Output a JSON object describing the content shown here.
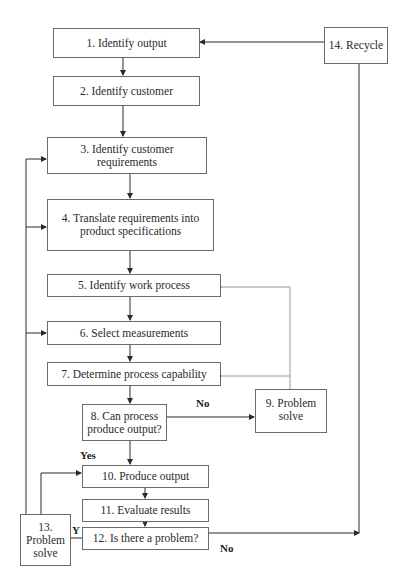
{
  "diagram": {
    "type": "flowchart",
    "nodes": [
      {
        "id": "1",
        "label": "1.  Identify output"
      },
      {
        "id": "2",
        "label": "2. Identify customer"
      },
      {
        "id": "3",
        "label": "3. Identify customer requirements"
      },
      {
        "id": "4",
        "label": "4. Translate requirements into product specifications"
      },
      {
        "id": "5",
        "label": "5. Identify work process"
      },
      {
        "id": "6",
        "label": "6. Select measurements"
      },
      {
        "id": "7",
        "label": "7. Determine process capability"
      },
      {
        "id": "8",
        "label": "8. Can process produce output?"
      },
      {
        "id": "9",
        "label": "9. Problem solve"
      },
      {
        "id": "10",
        "label": "10. Produce output"
      },
      {
        "id": "11",
        "label": "11. Evaluate results"
      },
      {
        "id": "12",
        "label": "12. Is there a problem?"
      },
      {
        "id": "13",
        "label": "13. Problem solve"
      },
      {
        "id": "14",
        "label": "14. Recycle"
      }
    ],
    "edges": [
      {
        "from": "1",
        "to": "2"
      },
      {
        "from": "2",
        "to": "3"
      },
      {
        "from": "3",
        "to": "4"
      },
      {
        "from": "4",
        "to": "5"
      },
      {
        "from": "5",
        "to": "6"
      },
      {
        "from": "6",
        "to": "7"
      },
      {
        "from": "7",
        "to": "8"
      },
      {
        "from": "8",
        "to": "9",
        "label": "No"
      },
      {
        "from": "8",
        "to": "10",
        "label": "Yes"
      },
      {
        "from": "9",
        "to": "5"
      },
      {
        "from": "9",
        "to": "7"
      },
      {
        "from": "10",
        "to": "11"
      },
      {
        "from": "11",
        "to": "12"
      },
      {
        "from": "12",
        "to": "13",
        "label": "Y"
      },
      {
        "from": "12",
        "to": "14",
        "label": "No"
      },
      {
        "from": "13",
        "to": "3"
      },
      {
        "from": "13",
        "to": "4"
      },
      {
        "from": "13",
        "to": "6"
      },
      {
        "from": "13",
        "to": "10"
      },
      {
        "from": "14",
        "to": "1"
      }
    ],
    "edge_labels": {
      "no_8_9": "No",
      "yes_8_10": "Yes",
      "y_12_13": "Y",
      "no_12_14": "No"
    }
  },
  "boxes": {
    "b1": {
      "line1": "1.  Identify output"
    },
    "b2": {
      "line1": "2. Identify customer"
    },
    "b3": {
      "line1": "3. Identify customer",
      "line2": "requirements"
    },
    "b4": {
      "line1": "4. Translate requirements into",
      "line2": "product specifications"
    },
    "b5": {
      "line1": "5. Identify work process"
    },
    "b6": {
      "line1": "6. Select measurements"
    },
    "b7": {
      "line1": "7. Determine process capability"
    },
    "b8": {
      "line1": "8. Can process",
      "line2": "produce output?"
    },
    "b9": {
      "line1": "9. Problem",
      "line2": "solve"
    },
    "b10": {
      "line1": "10. Produce output"
    },
    "b11": {
      "line1": "11. Evaluate results"
    },
    "b12": {
      "line1": "12. Is there a problem?"
    },
    "b13": {
      "line1": "13.",
      "line2": "Problem",
      "line3": "solve"
    },
    "b14": {
      "line1": "14. Recycle"
    }
  },
  "colors": {
    "line": "#2a2a2a",
    "feedback_line": "#9a9a9a",
    "box_border": "#6a6a6a"
  }
}
